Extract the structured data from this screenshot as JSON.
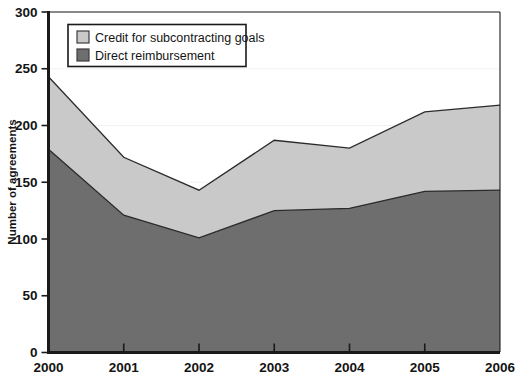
{
  "chart_data": {
    "type": "area",
    "stacked": true,
    "title": "",
    "xlabel": "",
    "ylabel": "Number of agreements",
    "categories": [
      "2000",
      "2001",
      "2002",
      "2003",
      "2004",
      "2005",
      "2006"
    ],
    "x_tick_labels": [
      "2000",
      "2001",
      "2002",
      "2003",
      "2004",
      "2005",
      "2006"
    ],
    "y_tick_labels": [
      "0",
      "50",
      "100",
      "150",
      "200",
      "250",
      "300"
    ],
    "y_ticks": [
      0,
      50,
      100,
      150,
      200,
      250,
      300
    ],
    "ylim": [
      0,
      300
    ],
    "grid": "horizontal-faint",
    "legend_position": "top-left-inside",
    "series": [
      {
        "name": "Credit for subcontracting goals",
        "color": "#c9c9c9",
        "values": [
          64,
          51,
          42,
          62,
          53,
          70,
          75
        ]
      },
      {
        "name": "Direct reimbursement",
        "color": "#6e6e6e",
        "values": [
          179,
          121,
          101,
          125,
          127,
          142,
          143
        ]
      }
    ],
    "totals": [
      243,
      172,
      143,
      187,
      180,
      212,
      218
    ]
  },
  "legend": {
    "items": [
      {
        "label": "Credit for subcontracting goals",
        "color": "#c9c9c9"
      },
      {
        "label": "Direct reimbursement",
        "color": "#6e6e6e"
      }
    ]
  },
  "axes": {
    "y_title": "Number of agreements"
  },
  "colors": {
    "light_series": "#c9c9c9",
    "dark_series": "#6e6e6e",
    "outline": "#2b2b2b",
    "axis": "#1a1a1a",
    "gridline": "#f2f2f2",
    "background": "#ffffff"
  }
}
